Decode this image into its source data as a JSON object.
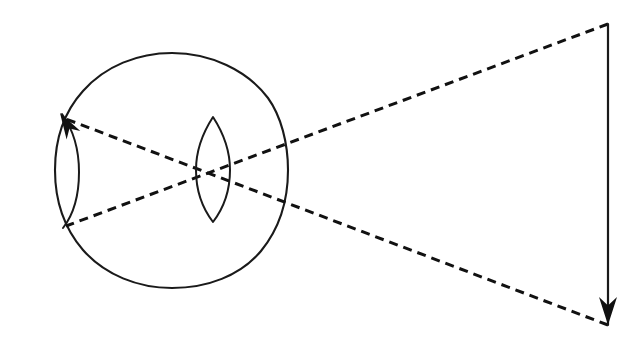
{
  "figure": {
    "domain": "Diagram",
    "width": 638,
    "height": 350,
    "background_color": "#ffffff",
    "ink_color": "#111111",
    "outline_color": "#1a1a1a",
    "style": "hand-drawn line art, black ink on white, no labels or text"
  },
  "elements": {
    "eyeball": {
      "name": "eyeball-outline",
      "shape": "closed irregular circle (hand drawn)",
      "center_x": 172,
      "center_y": 170,
      "radius": 117,
      "stroke_width": 2.1,
      "path": "M 172 53 C 210 53 247 70 268 98 C 281 116 288 143 288 170 C 288 200 279 229 261 251 C 240 276 207 288 172 288 C 138 288 105 275 83 250 C 64 228 55 200 55 170 C 55 140 64 112 83 91 C 105 66 138 53 172 53 Z"
    },
    "lens": {
      "name": "crystalline-lens",
      "shape": "biconvex vesica (pointed oval)",
      "center_x": 213,
      "center_y": 170,
      "top_y": 117,
      "bottom_y": 222,
      "half_width": 17,
      "stroke_width": 2.0,
      "path": "M 213 117 C 226 137 230 154 230 170 C 230 188 226 205 213 222 C 200 205 196 188 196 170 C 196 154 200 137 213 117 Z"
    },
    "object_arrow": {
      "name": "object-arrow",
      "description": "upright external object drawn as a vertical line with a solid arrowhead at its lower end",
      "x": 608,
      "top_y": 24,
      "bottom_y": 325,
      "arrowhead_direction": "down",
      "arrowhead_length": 28,
      "arrowhead_half_width": 9,
      "stroke_width": 2.2
    },
    "retinal_image_arrow": {
      "name": "retinal-image-arrow",
      "description": "inverted image formed on the retina, drawn as a curved line hugging the inner retinal wall with a solid arrowhead at its upper end",
      "tail_x": 63,
      "tail_y": 228,
      "tip_x": 60,
      "tip_y": 113,
      "bulge_x": 78,
      "arrowhead_direction": "up",
      "arrowhead_length": 26,
      "arrowhead_half_width": 8,
      "stroke_width": 2.0,
      "path": "M 63 228 C 74 214 79 196 79 172 C 79 148 72 128 62 114"
    },
    "ray_upper": {
      "name": "ray-upper-dashed",
      "description": "dashed light ray from the top of the object, through the lens, to the bottom of the retinal image",
      "from_x": 608,
      "from_y": 24,
      "to_x": 66,
      "to_y": 226,
      "dash_length": 9,
      "dash_gap": 6,
      "stroke_width": 3.0
    },
    "ray_lower": {
      "name": "ray-lower-dashed",
      "description": "dashed light ray from the bottom of the object, through the lens, to the tip of the retinal image arrow",
      "from_x": 608,
      "from_y": 325,
      "to_x": 66,
      "to_y": 119,
      "dash_length": 9,
      "dash_gap": 6,
      "stroke_width": 3.0
    },
    "crossing_point": {
      "name": "ray-crossing-point",
      "description": "point inside the lens where the two dashed rays intersect, producing the inverted retinal image",
      "x": 211,
      "y": 172
    }
  },
  "labels": {
    "visible_text": [],
    "note": "no text or annotations appear anywhere in the figure"
  }
}
